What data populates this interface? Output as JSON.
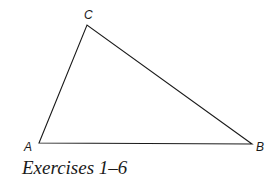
{
  "figure": {
    "type": "triangle",
    "vertices": {
      "A": {
        "label": "A",
        "x": 39,
        "y": 143
      },
      "B": {
        "label": "B",
        "x": 252,
        "y": 144
      },
      "C": {
        "label": "C",
        "x": 87,
        "y": 25
      }
    },
    "stroke_color": "#1a1a1a"
  },
  "caption": "Exercises 1–6"
}
